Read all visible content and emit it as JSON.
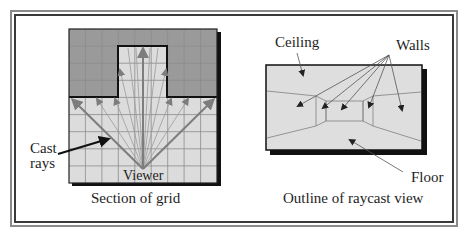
{
  "left_panel": {
    "caption": "Section of grid",
    "viewer_label": "Viewer",
    "cast_rays_label_line1": "Cast",
    "cast_rays_label_line2": "rays",
    "grid": {
      "columns": 9,
      "rows": 9,
      "wall_rows_top": 4,
      "open_corridor_columns": [
        3,
        5
      ],
      "open_corridor_depth_rows": 3
    }
  },
  "right_panel": {
    "caption": "Outline of raycast view",
    "labels": {
      "ceiling": "Ceiling",
      "walls": "Walls",
      "floor": "Floor"
    }
  },
  "colors": {
    "wall_fill": "#9a9a9a",
    "floor_fill": "#dcdcdc",
    "grid_line": "#8c8c8c",
    "ray": "#8a8a8a",
    "border": "#1a1a1a",
    "view_fill": "#dedede"
  }
}
